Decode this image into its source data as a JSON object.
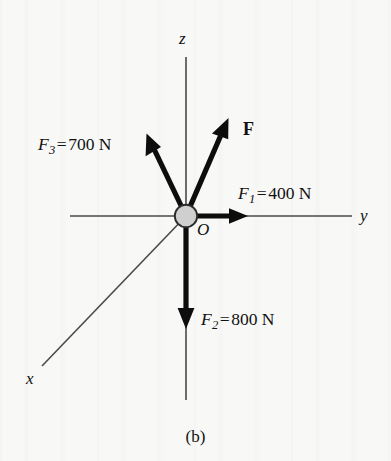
{
  "figure": {
    "caption": "(b)",
    "origin_label": "O",
    "axes": [
      {
        "name": "z",
        "label": "z"
      },
      {
        "name": "y",
        "label": "y"
      },
      {
        "name": "x",
        "label": "x"
      }
    ],
    "forces": [
      {
        "name": "F1",
        "symbol": "F",
        "subscript": "1",
        "equals": "=",
        "magnitude": "400",
        "unit": "N",
        "full_label": "F1 = 400 N",
        "direction": "+y (right)"
      },
      {
        "name": "F2",
        "symbol": "F",
        "subscript": "2",
        "equals": "=",
        "magnitude": "800",
        "unit": "N",
        "full_label": "F2 = 800 N",
        "direction": "-z (down)"
      },
      {
        "name": "F3",
        "symbol": "F",
        "subscript": "3",
        "equals": "=",
        "magnitude": "700",
        "unit": "N",
        "full_label": "F3 = 700 N",
        "direction": "up-left"
      }
    ],
    "resultant": {
      "name": "F",
      "label": "F",
      "direction": "up-right"
    }
  },
  "colors": {
    "background": "#f8f8f7",
    "ink": "#111111",
    "axis_line": "#4a4a4a",
    "vector": "#0d0d0d",
    "origin_fill": "#cfcfcf",
    "origin_stroke": "#2b2b2b"
  }
}
